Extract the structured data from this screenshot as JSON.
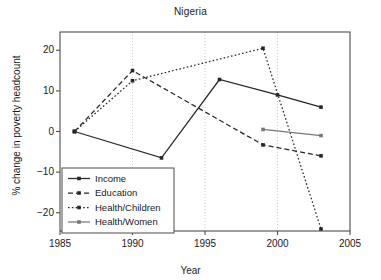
{
  "chart_data": {
    "type": "line",
    "title": "Nigeria",
    "xlabel": "Year",
    "ylabel": "% change in poverty headcount",
    "xlim": [
      1985,
      2005
    ],
    "ylim": [
      -24.5,
      24.5
    ],
    "xticks": [
      1985,
      1990,
      1995,
      2000,
      2005
    ],
    "xtick_labels": [
      "1985",
      "1990",
      "1995",
      "2000",
      "2005"
    ],
    "yticks": [
      20,
      10,
      0,
      -10,
      -20
    ],
    "ytick_labels": [
      "20",
      "10",
      "0",
      "−10",
      "−20"
    ],
    "grid": "vertical gridlines at 1990, 1995, 2000",
    "legend_position": "lower left",
    "series": [
      {
        "name": "Income",
        "style": "solid",
        "color": "#262626",
        "marker": "square",
        "x": [
          1986,
          1992,
          1996,
          2000,
          2003
        ],
        "values": [
          0,
          -6.5,
          12.8,
          9.0,
          6.0
        ]
      },
      {
        "name": "Education",
        "style": "dashed",
        "color": "#262626",
        "marker": "square",
        "x": [
          1986,
          1990,
          1999,
          2003
        ],
        "values": [
          0,
          15.0,
          -3.3,
          -6.0
        ]
      },
      {
        "name": "Health/Children",
        "style": "dotted",
        "color": "#262626",
        "marker": "square",
        "x": [
          1986,
          1990,
          1999,
          2003
        ],
        "values": [
          0,
          12.5,
          20.5,
          -24.0
        ]
      },
      {
        "name": "Health/Women",
        "style": "solid",
        "color": "#777777",
        "marker": "square",
        "x": [
          1999,
          2003
        ],
        "values": [
          0.5,
          -1.0
        ]
      }
    ]
  }
}
